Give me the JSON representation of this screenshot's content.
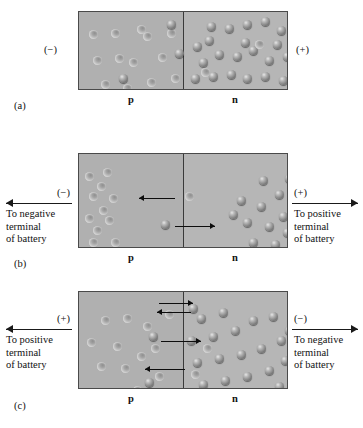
{
  "figure": {
    "type": "pn-junction-bias-diagram",
    "panels": [
      {
        "tag": "(a)",
        "caption_left_sign": "(−)",
        "caption_right_sign": "(+)",
        "region_left_label": "p",
        "region_right_label": "n",
        "terminal_left": "",
        "terminal_right": "",
        "state": "no-bias"
      },
      {
        "tag": "(b)",
        "caption_left_sign": "(−)",
        "caption_right_sign": "(+)",
        "region_left_label": "p",
        "region_right_label": "n",
        "terminal_left": "To negative\nterminal\nof battery",
        "terminal_left_line1": "To negative",
        "terminal_left_line2": "terminal",
        "terminal_left_line3": "of battery",
        "terminal_right_line1": "To positive",
        "terminal_right_line2": "terminal",
        "terminal_right_line3": "of battery",
        "state": "reverse-bias"
      },
      {
        "tag": "(c)",
        "caption_left_sign": "(+)",
        "caption_right_sign": "(−)",
        "region_left_label": "p",
        "region_right_label": "n",
        "terminal_left_line1": "To positive",
        "terminal_left_line2": "terminal",
        "terminal_left_line3": "of battery",
        "terminal_right_line1": "To negative",
        "terminal_right_line2": "terminal",
        "terminal_right_line3": "of battery",
        "state": "forward-bias"
      }
    ],
    "colors": {
      "p_region": "#b0b0b0",
      "n_region": "#b6b6b6",
      "border": "#4a4a4a",
      "divider": "#3a3a3a",
      "arrow": "#1a1a1a",
      "background": "#ffffff"
    },
    "legend": {
      "electron": "dark convex sphere",
      "hole": "light concave sphere"
    }
  },
  "panel_a": {
    "holes": [
      [
        14,
        44
      ],
      [
        32,
        17
      ],
      [
        50,
        46
      ],
      [
        64,
        20
      ],
      [
        79,
        41
      ],
      [
        22,
        68
      ],
      [
        44,
        72
      ],
      [
        68,
        66
      ],
      [
        10,
        18
      ],
      [
        88,
        17
      ],
      [
        36,
        42
      ],
      [
        58,
        13
      ],
      [
        92,
        62
      ],
      [
        16,
        86
      ],
      [
        74,
        86
      ],
      [
        52,
        88
      ],
      [
        30,
        90
      ]
    ],
    "electrons": [
      [
        88,
        8
      ],
      [
        96,
        37
      ],
      [
        40,
        62
      ]
    ],
    "n_electrons": [
      [
        8,
        30
      ],
      [
        22,
        10
      ],
      [
        40,
        12
      ],
      [
        58,
        8
      ],
      [
        76,
        5
      ],
      [
        92,
        14
      ],
      [
        108,
        10
      ],
      [
        14,
        46
      ],
      [
        30,
        38
      ],
      [
        48,
        40
      ],
      [
        64,
        34
      ],
      [
        80,
        44
      ],
      [
        98,
        40
      ],
      [
        112,
        30
      ],
      [
        6,
        62
      ],
      [
        24,
        60
      ],
      [
        42,
        58
      ],
      [
        58,
        62
      ],
      [
        76,
        60
      ],
      [
        94,
        64
      ],
      [
        110,
        58
      ],
      [
        12,
        80
      ],
      [
        30,
        82
      ],
      [
        48,
        84
      ],
      [
        66,
        80
      ],
      [
        84,
        82
      ],
      [
        100,
        80
      ],
      [
        114,
        74
      ],
      [
        20,
        24
      ],
      [
        56,
        26
      ],
      [
        88,
        28
      ]
    ],
    "n_holes": [
      [
        70,
        28
      ],
      [
        16,
        56
      ]
    ]
  },
  "panel_b": {
    "holes": [
      [
        6,
        18
      ],
      [
        24,
        14
      ],
      [
        10,
        38
      ],
      [
        30,
        40
      ],
      [
        6,
        60
      ],
      [
        26,
        62
      ],
      [
        10,
        84
      ],
      [
        32,
        84
      ],
      [
        18,
        28
      ],
      [
        20,
        52
      ],
      [
        14,
        72
      ]
    ],
    "junction_hole": [
      106,
      38
    ],
    "junction_electron": [
      82,
      66
    ],
    "n_electrons": [
      [
        180,
        22
      ],
      [
        158,
        42
      ],
      [
        178,
        48
      ],
      [
        196,
        36
      ],
      [
        164,
        64
      ],
      [
        186,
        68
      ],
      [
        200,
        58
      ],
      [
        170,
        84
      ],
      [
        192,
        86
      ],
      [
        204,
        74
      ],
      [
        150,
        56
      ],
      [
        206,
        20
      ]
    ]
  },
  "panel_c": {
    "holes": [
      [
        22,
        24
      ],
      [
        44,
        22
      ],
      [
        8,
        46
      ],
      [
        34,
        50
      ],
      [
        18,
        70
      ],
      [
        42,
        72
      ],
      [
        30,
        96
      ],
      [
        54,
        94
      ],
      [
        64,
        30
      ],
      [
        72,
        52
      ],
      [
        58,
        60
      ],
      [
        76,
        80
      ],
      [
        12,
        96
      ],
      [
        86,
        18
      ]
    ],
    "p_electrons": [
      [
        70,
        40
      ],
      [
        84,
        96
      ],
      [
        66,
        86
      ]
    ],
    "n_electrons": [
      [
        118,
        22
      ],
      [
        140,
        16
      ],
      [
        108,
        44
      ],
      [
        130,
        40
      ],
      [
        152,
        34
      ],
      [
        170,
        24
      ],
      [
        190,
        20
      ],
      [
        114,
        66
      ],
      [
        136,
        62
      ],
      [
        158,
        58
      ],
      [
        178,
        52
      ],
      [
        198,
        44
      ],
      [
        120,
        88
      ],
      [
        142,
        84
      ],
      [
        164,
        80
      ],
      [
        186,
        74
      ],
      [
        202,
        64
      ],
      [
        104,
        96
      ],
      [
        128,
        100
      ],
      [
        150,
        98
      ],
      [
        172,
        96
      ],
      [
        196,
        90
      ],
      [
        110,
        12
      ],
      [
        206,
        34
      ]
    ],
    "n_holes": [
      [
        124,
        52
      ],
      [
        112,
        78
      ]
    ]
  }
}
